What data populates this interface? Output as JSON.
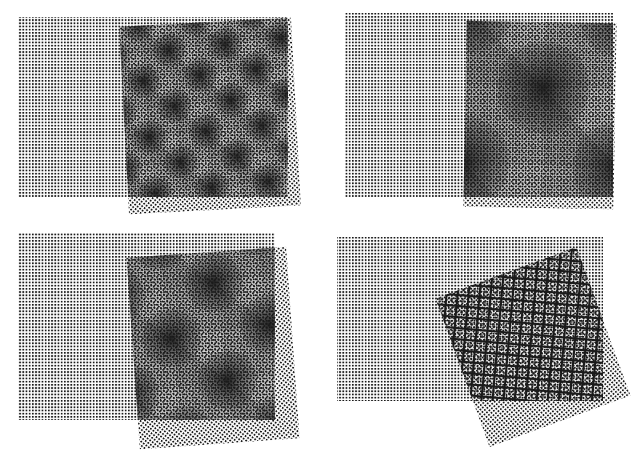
{
  "page": {
    "background": "#ffffff",
    "ink": "#1a1a1a",
    "page_number": ""
  },
  "figure": {
    "panels": [
      {
        "id": "top-left",
        "base": {
          "x": 18,
          "y": 17,
          "w": 270,
          "h": 180
        },
        "overlay": {
          "cx": 210,
          "cy": 116,
          "w": 172,
          "h": 188,
          "rotate": -3
        },
        "moire": "star-lattice",
        "moire_period": 40,
        "dot_period": 3.2
      },
      {
        "id": "top-right",
        "base": {
          "x": 345,
          "y": 13,
          "w": 268,
          "h": 184
        },
        "overlay": {
          "cx": 540,
          "cy": 115,
          "w": 150,
          "h": 186,
          "rotate": 1
        },
        "moire": "large-blobs",
        "moire_period": 110,
        "dot_period": 3.2
      },
      {
        "id": "bottom-left",
        "base": {
          "x": 18,
          "y": 233,
          "w": 257,
          "h": 187
        },
        "overlay": {
          "cx": 213,
          "cy": 348,
          "w": 160,
          "h": 192,
          "rotate": -4
        },
        "moire": "star-lattice",
        "moire_period": 70,
        "dot_period": 3.2
      },
      {
        "id": "bottom-right",
        "base": {
          "x": 337,
          "y": 237,
          "w": 266,
          "h": 164
        },
        "overlay": {
          "cx": 533,
          "cy": 347,
          "w": 150,
          "h": 158,
          "rotate": -20
        },
        "moire": "crosshatch",
        "moire_period": 11,
        "dot_period": 3.2
      }
    ]
  }
}
